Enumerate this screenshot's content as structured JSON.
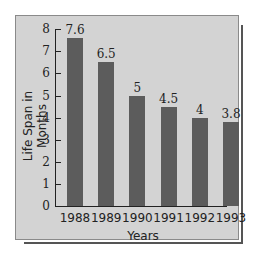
{
  "chart_data": {
    "type": "bar",
    "title": "",
    "xlabel": "Years",
    "ylabel": "Life Span in Months",
    "categories": [
      "1988",
      "1989",
      "1990",
      "1991",
      "1992",
      "1993"
    ],
    "values": [
      7.6,
      6.5,
      5,
      4.5,
      4,
      3.8
    ],
    "value_labels": [
      "7.6",
      "6.5",
      "5",
      "4.5",
      "4",
      "3.8"
    ],
    "ylim": [
      0,
      8
    ],
    "yticks": [
      "0",
      "1",
      "2",
      "3",
      "4",
      "5",
      "6",
      "7",
      "8"
    ],
    "grid": false,
    "legend": null,
    "colors": {
      "bar": "#5c5c5c",
      "panel": "#d3d3d3",
      "axis": "#222222"
    }
  }
}
